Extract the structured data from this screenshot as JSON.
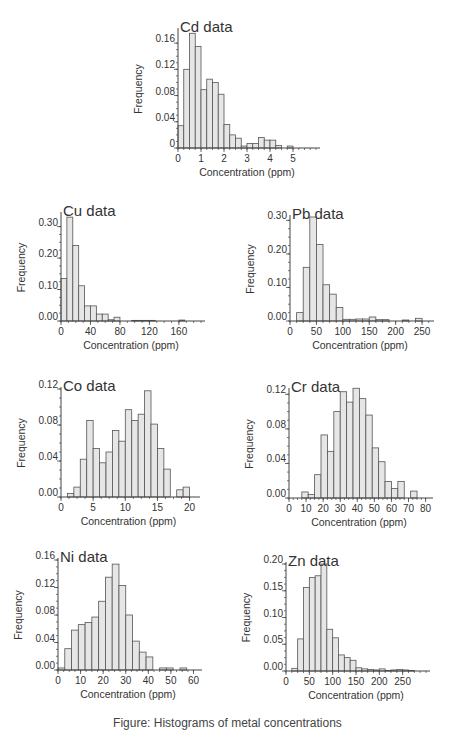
{
  "caption": "Figure: Histograms of metal concentrations",
  "style": {
    "bar_fill": "#e6e6e6",
    "bar_stroke": "#555555",
    "axis_color": "#444444"
  },
  "chart_data": [
    {
      "id": "cd",
      "type": "bar",
      "title": "Cd data",
      "xlabel": "Concentration (ppm)",
      "ylabel": "Frequency",
      "xlim": [
        0,
        6
      ],
      "ylim": [
        0,
        0.18
      ],
      "xticks": [
        0,
        1,
        2,
        3,
        4,
        5
      ],
      "xtick_labels": [
        "0",
        "1",
        "2",
        "3",
        "4",
        "5"
      ],
      "yticks": [
        0,
        0.04,
        0.08,
        0.12,
        0.16
      ],
      "ytick_labels": [
        "0",
        "0.04",
        "0.08",
        "0.12",
        "0.16"
      ],
      "bin_start": 0,
      "bin_width": 0.25,
      "values": [
        0.034,
        0.12,
        0.175,
        0.155,
        0.089,
        0.105,
        0.1,
        0.082,
        0.036,
        0.02,
        0.015,
        0.003,
        0.007,
        0.007,
        0.016,
        0.012,
        0.012,
        0.004,
        0,
        0.003
      ],
      "box": {
        "left": 178,
        "top": 30,
        "width": 138,
        "height": 118
      }
    },
    {
      "id": "cu",
      "type": "bar",
      "title": "Cu data",
      "xlabel": "Concentration (ppm)",
      "ylabel": "Frequency",
      "xlim": [
        0,
        190
      ],
      "ylim": [
        0,
        0.34
      ],
      "xticks": [
        0,
        40,
        80,
        120,
        160
      ],
      "xtick_labels": [
        "0",
        "40",
        "80",
        "120",
        "160"
      ],
      "yticks": [
        0,
        0.1,
        0.2,
        0.3
      ],
      "ytick_labels": [
        "0.00",
        "0.10",
        "0.20",
        "0.30"
      ],
      "bin_start": 0,
      "bin_width": 8,
      "values": [
        0.135,
        0.33,
        0.24,
        0.112,
        0.048,
        0.048,
        0.022,
        0.022,
        0.004,
        0.012,
        0,
        0,
        0.002,
        0.002,
        0.002,
        0.002,
        0,
        0,
        0,
        0,
        0.003
      ],
      "box": {
        "left": 61,
        "top": 214,
        "width": 140,
        "height": 107
      }
    },
    {
      "id": "pb",
      "type": "bar",
      "title": "Pb data",
      "xlabel": "Concentration (ppm)",
      "ylabel": "Frequency",
      "xlim": [
        0,
        265
      ],
      "ylim": [
        0,
        0.31
      ],
      "xticks": [
        0,
        50,
        100,
        150,
        200,
        250
      ],
      "xtick_labels": [
        "0",
        "50",
        "100",
        "150",
        "200",
        "250"
      ],
      "yticks": [
        0,
        0.1,
        0.2,
        0.3
      ],
      "ytick_labels": [
        "0.00",
        "0.10",
        "0.20",
        "0.30"
      ],
      "bin_start": 12.5,
      "bin_width": 12.5,
      "values": [
        0.025,
        0.16,
        0.31,
        0.228,
        0.108,
        0.08,
        0.04,
        0.005,
        0.005,
        0.006,
        0.006,
        0.012,
        0.004,
        0.004,
        0,
        0,
        0.003,
        0,
        0.008,
        0
      ],
      "box": {
        "left": 290,
        "top": 217,
        "width": 140,
        "height": 104
      }
    },
    {
      "id": "co",
      "type": "bar",
      "title": "Co data",
      "xlabel": "Concentration (ppm)",
      "ylabel": "Frequency",
      "xlim": [
        0,
        21
      ],
      "ylim": [
        0,
        0.12
      ],
      "xticks": [
        0,
        5,
        10,
        15,
        20
      ],
      "xtick_labels": [
        "0",
        "5",
        "10",
        "15",
        "20"
      ],
      "yticks": [
        0,
        0.04,
        0.08,
        0.12
      ],
      "ytick_labels": [
        "0.00",
        "0.04",
        "0.08",
        "0.12"
      ],
      "bin_start": 1,
      "bin_width": 1,
      "values": [
        0.004,
        0.011,
        0.042,
        0.085,
        0.054,
        0.038,
        0.05,
        0.074,
        0.062,
        0.097,
        0.085,
        0.092,
        0.118,
        0.081,
        0.054,
        0.031,
        0,
        0.008,
        0.011
      ],
      "box": {
        "left": 61,
        "top": 389,
        "width": 135,
        "height": 108
      }
    },
    {
      "id": "cr",
      "type": "bar",
      "title": "Cr data",
      "xlabel": "Concentration (ppm)",
      "ylabel": "Frequency",
      "xlim": [
        0,
        82
      ],
      "ylim": [
        0,
        0.125
      ],
      "xticks": [
        0,
        10,
        20,
        30,
        40,
        50,
        60,
        70,
        80
      ],
      "xtick_labels": [
        "0",
        "10",
        "20",
        "30",
        "40",
        "50",
        "60",
        "70",
        "80"
      ],
      "yticks": [
        0,
        0.04,
        0.08,
        0.12
      ],
      "ytick_labels": [
        "0.00",
        "0.04",
        "0.08",
        "0.12"
      ],
      "bin_start": 7.5,
      "bin_width": 3.75,
      "values": [
        0.007,
        0.004,
        0.027,
        0.073,
        0.054,
        0.1,
        0.123,
        0.111,
        0.127,
        0.115,
        0.096,
        0.058,
        0.042,
        0.019,
        0.011,
        0.019,
        0,
        0.008
      ],
      "box": {
        "left": 289,
        "top": 390,
        "width": 140,
        "height": 108
      }
    },
    {
      "id": "ni",
      "type": "bar",
      "title": "Ni data",
      "xlabel": "Concentration (ppm)",
      "ylabel": "Frequency",
      "xlim": [
        0,
        62
      ],
      "ylim": [
        0,
        0.16
      ],
      "xticks": [
        0,
        10,
        20,
        30,
        40,
        50,
        60
      ],
      "xtick_labels": [
        "0",
        "10",
        "20",
        "30",
        "40",
        "50",
        "60"
      ],
      "yticks": [
        0,
        0.04,
        0.08,
        0.12,
        0.16
      ],
      "ytick_labels": [
        "0.00",
        "0.04",
        "0.08",
        "0.12",
        "0.16"
      ],
      "bin_start": 0,
      "bin_width": 3,
      "values": [
        0.003,
        0.031,
        0.058,
        0.066,
        0.069,
        0.077,
        0.1,
        0.135,
        0.154,
        0.123,
        0.08,
        0.042,
        0.026,
        0.019,
        0,
        0.003,
        0.003,
        0,
        0.003
      ],
      "box": {
        "left": 58,
        "top": 560,
        "width": 140,
        "height": 110
      }
    },
    {
      "id": "zn",
      "type": "bar",
      "title": "Zn data",
      "xlabel": "Concentration (ppm)",
      "ylabel": "Frequency",
      "xlim": [
        0,
        300
      ],
      "ylim": [
        0,
        0.2
      ],
      "xticks": [
        0,
        50,
        100,
        150,
        200,
        250
      ],
      "xtick_labels": [
        "0",
        "50",
        "100",
        "150",
        "200",
        "250"
      ],
      "yticks": [
        0,
        0.05,
        0.1,
        0.15,
        0.2
      ],
      "ytick_labels": [
        "0.00",
        "0.05",
        "0.10",
        "0.15",
        "0.20"
      ],
      "bin_start": 12.5,
      "bin_width": 12.5,
      "values": [
        0.005,
        0.06,
        0.156,
        0.175,
        0.178,
        0.2,
        0.078,
        0.062,
        0.03,
        0.025,
        0.02,
        0.006,
        0.004,
        0.003,
        0.002,
        0.004,
        0.001,
        0.002,
        0.003,
        0.002,
        0.001
      ],
      "box": {
        "left": 286,
        "top": 564,
        "width": 140,
        "height": 107
      }
    }
  ]
}
